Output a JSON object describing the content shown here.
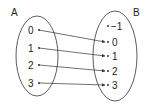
{
  "diagram": {
    "type": "mapping",
    "sets": {
      "A": {
        "label": "A",
        "elements": [
          "0",
          "1",
          "2",
          "3"
        ]
      },
      "B": {
        "label": "B",
        "elements": [
          "−1",
          "0",
          "1",
          "2",
          "3"
        ]
      }
    },
    "mappings": [
      {
        "from": "0",
        "to": "0"
      },
      {
        "from": "1",
        "to": "1"
      },
      {
        "from": "2",
        "to": "2"
      },
      {
        "from": "3",
        "to": "3"
      }
    ],
    "colors": {
      "stroke": "#333333",
      "text": "#222222"
    }
  }
}
